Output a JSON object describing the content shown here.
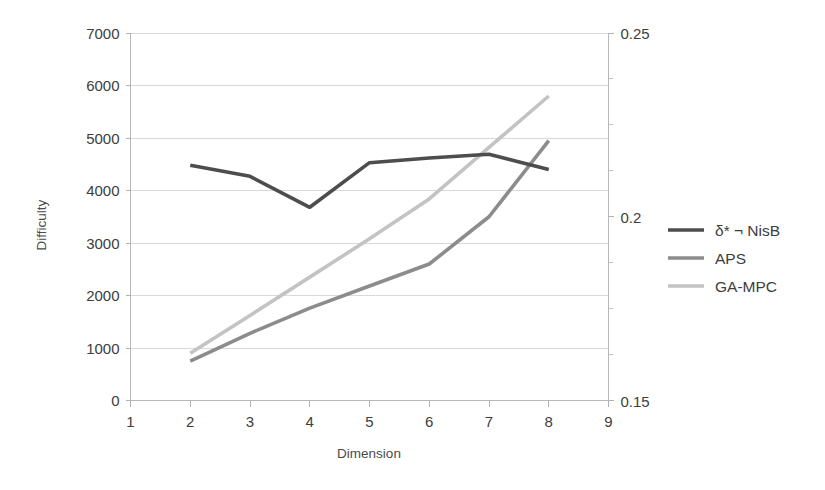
{
  "chart_data": {
    "type": "line",
    "title": "",
    "xlabel": "Dimension",
    "ylabel": "Difficulty",
    "y2label": "",
    "x": [
      2,
      3,
      4,
      5,
      6,
      7,
      8
    ],
    "xlim": [
      1,
      9
    ],
    "ylim": [
      0,
      7000
    ],
    "y2lim": [
      0.15,
      0.25
    ],
    "xticks": [
      "1",
      "2",
      "3",
      "4",
      "5",
      "6",
      "7",
      "8",
      "9"
    ],
    "yticks": [
      "0",
      "1000",
      "2000",
      "3000",
      "4000",
      "5000",
      "6000",
      "7000"
    ],
    "y2ticks": [
      "0.15",
      "0.2",
      "0.25"
    ],
    "grid": "horizontal",
    "legend_position": "right",
    "markers": "none",
    "series": [
      {
        "name": "δ* ¬ NisB",
        "axis": "left",
        "color": "#4d4d4d",
        "values": [
          4480,
          4270,
          3680,
          4530,
          4620,
          4690,
          4400
        ]
      },
      {
        "name": "APS",
        "axis": "left",
        "color": "#8c8c8c",
        "values": [
          750,
          1280,
          1760,
          2180,
          2600,
          3500,
          4950
        ]
      },
      {
        "name": "GA-MPC",
        "axis": "left",
        "color": "#c3c3c3",
        "values": [
          900,
          1620,
          2350,
          3080,
          3840,
          4820,
          5800
        ]
      }
    ]
  },
  "legend": {
    "entries": [
      {
        "label": "δ* ¬ NisB",
        "color": "#4d4d4d"
      },
      {
        "label": "APS",
        "color": "#8c8c8c"
      },
      {
        "label": "GA-MPC",
        "color": "#c3c3c3"
      }
    ]
  },
  "axes": {
    "y_left": {
      "title": "Difficulty",
      "ticks": [
        "7000",
        "6000",
        "5000",
        "4000",
        "3000",
        "2000",
        "1000",
        "0"
      ]
    },
    "y_right": {
      "ticks": [
        "0.25",
        "0.2",
        "0.15"
      ]
    },
    "x": {
      "title": "Dimension",
      "ticks": [
        "1",
        "2",
        "3",
        "4",
        "5",
        "6",
        "7",
        "8",
        "9"
      ]
    }
  }
}
